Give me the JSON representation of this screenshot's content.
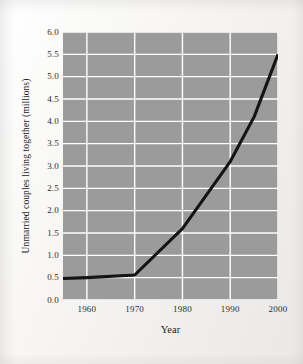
{
  "chart_data": {
    "type": "line",
    "title": "",
    "xlabel": "Year",
    "ylabel": "Unmarried couples living together (millions)",
    "xlim": [
      1955,
      2000
    ],
    "ylim": [
      0.0,
      6.0
    ],
    "grid": true,
    "legend": false,
    "legend_position": "none",
    "line_color": "#141414",
    "plot_background": "#9b9b9b",
    "gridline_color": "#ffffff",
    "x_ticks": [
      1960,
      1970,
      1980,
      1990,
      2000
    ],
    "x_tick_labels": [
      "1960",
      "1970",
      "1980",
      "1990",
      "2000"
    ],
    "y_ticks": [
      0.0,
      0.5,
      1.0,
      1.5,
      2.0,
      2.5,
      3.0,
      3.5,
      4.0,
      4.5,
      5.0,
      5.5,
      6.0
    ],
    "y_tick_labels": [
      "0.0",
      "0.5",
      "1.0",
      "1.5",
      "2.0",
      "2.5",
      "3.0",
      "3.5",
      "4.0",
      "4.5",
      "5.0",
      "5.5",
      "6.0"
    ],
    "series": [
      {
        "name": "Unmarried couples living together",
        "x": [
          1955,
          1960,
          1970,
          1980,
          1990,
          1995,
          2000
        ],
        "values": [
          0.48,
          0.5,
          0.56,
          1.6,
          3.1,
          4.1,
          5.5
        ]
      }
    ]
  }
}
